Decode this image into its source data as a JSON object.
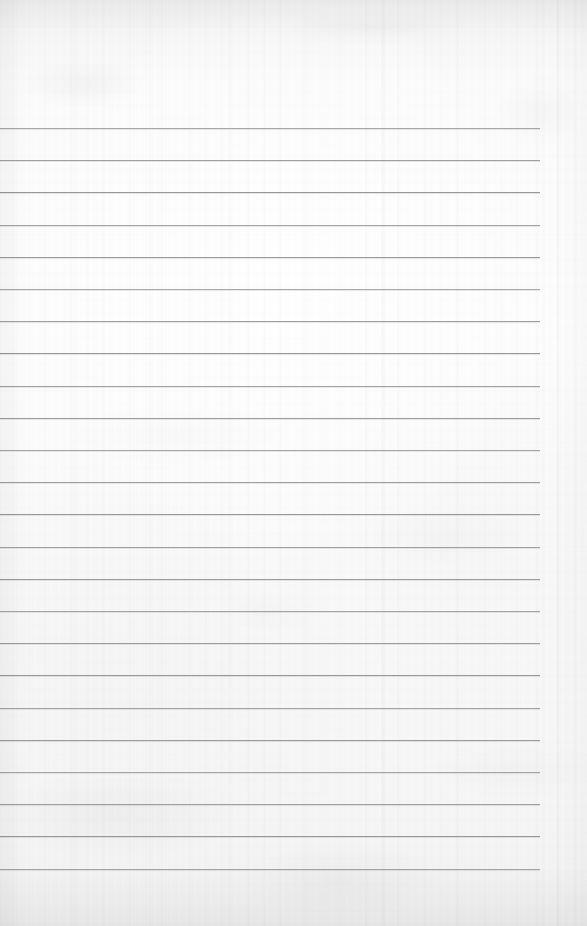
{
  "document": {
    "kind": "lined-notebook-paper",
    "title": "Lined Notebook Paper",
    "content_text": "",
    "page_width": 587,
    "page_height": 926,
    "paper_color": "#fafafa",
    "rule_color": "#8e9195",
    "texture": "vertical fibre grain with mottled blotches and edge vignette"
  },
  "ruling": {
    "line_count": 24,
    "spacing_px": 32.2,
    "first_line_y": 128,
    "last_line_y": 868,
    "line_start_x": 0,
    "line_end_x": 540,
    "right_margin_start_x": 540,
    "top_margin_height": 128,
    "bottom_margin_height": 58,
    "lines_y": [
      128,
      160.2,
      192.4,
      224.6,
      256.8,
      289.0,
      321.2,
      353.4,
      385.6,
      417.8,
      450.0,
      482.2,
      514.4,
      546.6,
      578.8,
      611.0,
      643.2,
      675.4,
      707.6,
      739.8,
      772.0,
      804.2,
      836.4,
      868.6
    ]
  },
  "seams": {
    "vertical_seam_x": 557
  },
  "fields": {
    "header_text": "",
    "body_placeholder": ""
  }
}
